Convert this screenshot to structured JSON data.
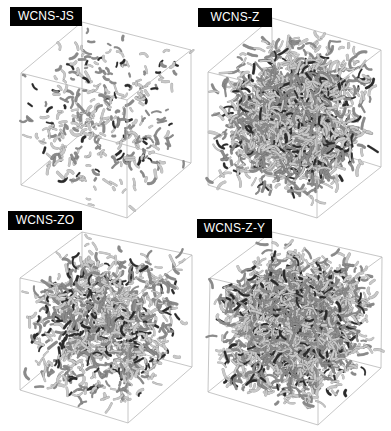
{
  "figure": {
    "panels": [
      {
        "id": "js",
        "label": "WCNS-JS",
        "label_box": {
          "x": 10,
          "y": 7,
          "w": 72,
          "h": 19
        },
        "cube": {
          "ftl": [
            21,
            73
          ],
          "ftr": [
            127,
            100
          ],
          "fbl": [
            21,
            185
          ],
          "fbr": [
            127,
            218
          ],
          "btl": [
            82,
            22
          ],
          "btr": [
            191,
            50
          ],
          "bbl": [
            82,
            133
          ],
          "bbr": [
            191,
            163
          ]
        },
        "density": "sparse",
        "tube_count": 330,
        "tube_length": [
          2,
          9
        ],
        "seed": 11
      },
      {
        "id": "z",
        "label": "WCNS-Z",
        "label_box": {
          "x": 198,
          "y": 8,
          "w": 74,
          "h": 19
        },
        "cube": {
          "ftl": [
            208,
            72
          ],
          "ftr": [
            317,
            99
          ],
          "fbl": [
            208,
            185
          ],
          "fbr": [
            317,
            218
          ],
          "btl": [
            272,
            18
          ],
          "btr": [
            381,
            50
          ],
          "bbl": [
            272,
            133
          ],
          "bbr": [
            381,
            167
          ]
        },
        "density": "dense",
        "tube_count": 1500,
        "tube_length": [
          4,
          12
        ],
        "seed": 23
      },
      {
        "id": "zo",
        "label": "WCNS-ZO",
        "label_box": {
          "x": 8,
          "y": 211,
          "w": 74,
          "h": 19
        },
        "cube": {
          "ftl": [
            20,
            278
          ],
          "ftr": [
            128,
            302
          ],
          "fbl": [
            20,
            390
          ],
          "fbr": [
            128,
            423
          ],
          "btl": [
            82,
            232
          ],
          "btr": [
            192,
            255
          ],
          "bbl": [
            82,
            338
          ],
          "bbr": [
            192,
            367
          ]
        },
        "density": "medium",
        "tube_count": 950,
        "tube_length": [
          3,
          11
        ],
        "seed": 37
      },
      {
        "id": "zy",
        "label": "WCNS-Z-Y",
        "label_box": {
          "x": 197,
          "y": 219,
          "w": 75,
          "h": 19
        },
        "cube": {
          "ftl": [
            210,
            278
          ],
          "ftr": [
            318,
            304
          ],
          "fbl": [
            208,
            392
          ],
          "fbr": [
            318,
            425
          ],
          "btl": [
            272,
            232
          ],
          "btr": [
            382,
            257
          ],
          "bbl": [
            272,
            340
          ],
          "bbr": [
            381,
            368
          ]
        },
        "density": "very-dense",
        "tube_count": 1900,
        "tube_length": [
          3,
          11
        ],
        "seed": 53
      }
    ],
    "colors": {
      "background": "#ffffff",
      "label_bg": "#000000",
      "label_text": "#ffffff",
      "cube_edge": "#b8b8b8",
      "tube_light": "#c8c8c8",
      "tube_mid": "#8a8a8a",
      "tube_dark": "#2a2a2a"
    }
  }
}
